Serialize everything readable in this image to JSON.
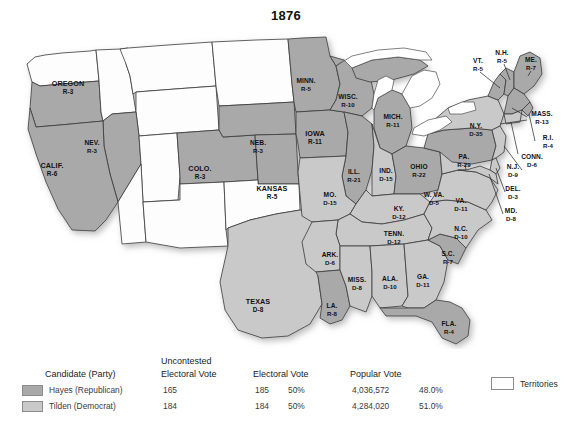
{
  "title": "1876",
  "colors": {
    "republican": "#a9a9a9",
    "democrat": "#c9c9c9",
    "territory": "#fdfdfd",
    "border": "#3a3a3a",
    "water": "#ffffff",
    "text": "#111111"
  },
  "legend": {
    "headers": {
      "candidate": "Candidate (Party)",
      "uncontested_line1": "Uncontested",
      "uncontested_line2": "Electoral Vote",
      "electoral": "Electoral Vote",
      "popular": "Popular Vote"
    },
    "rows": [
      {
        "swatch": "republican",
        "candidate": "Hayes (Republican)",
        "uncontested": "165",
        "electoral": "185",
        "electoral_pct": "50%",
        "popular": "4,036,572",
        "popular_pct": "48.0%"
      },
      {
        "swatch": "democrat",
        "candidate": "Tilden (Democrat)",
        "uncontested": "184",
        "electoral": "184",
        "electoral_pct": "50%",
        "popular": "4,284,020",
        "popular_pct": "51.0%"
      }
    ],
    "territories_label": "Territories"
  },
  "chart_data": {
    "type": "map",
    "title": "1876",
    "legend_position": "bottom",
    "party_codes": {
      "R": "Republican (Hayes)",
      "D": "Democrat (Tilden)",
      "T": "Territory"
    },
    "totals": {
      "hayes_electoral": 185,
      "tilden_electoral": 184,
      "hayes_uncontested": 165,
      "tilden_uncontested": 184,
      "hayes_popular": 4036572,
      "tilden_popular": 4284020,
      "hayes_popular_pct": 48.0,
      "tilden_popular_pct": 51.0,
      "hayes_electoral_pct": 50,
      "tilden_electoral_pct": 50
    },
    "states": [
      {
        "name": "OREGON",
        "party": "R",
        "ev": 3,
        "label": "OREGON",
        "ev_label": "R-3",
        "x": 68,
        "y": 64,
        "size": "big"
      },
      {
        "name": "CALIF.",
        "party": "R",
        "ev": 6,
        "label": "CALIF.",
        "ev_label": "R-6",
        "x": 52,
        "y": 146,
        "size": "big"
      },
      {
        "name": "NEV.",
        "party": "R",
        "ev": 3,
        "label": "NEV.",
        "ev_label": "R-3",
        "x": 92,
        "y": 122,
        "size": ""
      },
      {
        "name": "COLO.",
        "party": "R",
        "ev": 3,
        "label": "COLO.",
        "ev_label": "R-3",
        "x": 200,
        "y": 149,
        "size": "big"
      },
      {
        "name": "KANSAS",
        "party": "R",
        "ev": 5,
        "label": "KANSAS",
        "ev_label": "R-5",
        "x": 272,
        "y": 169,
        "size": "big"
      },
      {
        "name": "NEB.",
        "party": "R",
        "ev": 3,
        "label": "NEB.",
        "ev_label": "R-3",
        "x": 258,
        "y": 122,
        "size": ""
      },
      {
        "name": "MINN.",
        "party": "R",
        "ev": 5,
        "label": "MINN.",
        "ev_label": "R-5",
        "x": 306,
        "y": 60,
        "size": ""
      },
      {
        "name": "IOWA",
        "party": "R",
        "ev": 11,
        "label": "IOWA",
        "ev_label": "R-11",
        "x": 315,
        "y": 114,
        "size": "big"
      },
      {
        "name": "WISC.",
        "party": "R",
        "ev": 10,
        "label": "WISC.",
        "ev_label": "R-10",
        "x": 348,
        "y": 76,
        "size": ""
      },
      {
        "name": "MICH.",
        "party": "R",
        "ev": 11,
        "label": "MICH.",
        "ev_label": "R-11",
        "x": 393,
        "y": 96,
        "size": ""
      },
      {
        "name": "ILL.",
        "party": "R",
        "ev": 21,
        "label": "ILL.",
        "ev_label": "R-21",
        "x": 354,
        "y": 151,
        "size": ""
      },
      {
        "name": "IND.",
        "party": "D",
        "ev": 15,
        "label": "IND.",
        "ev_label": "D-15",
        "x": 386,
        "y": 150,
        "size": ""
      },
      {
        "name": "OHIO",
        "party": "R",
        "ev": 22,
        "label": "OHIO",
        "ev_label": "R-22",
        "x": 419,
        "y": 146,
        "size": ""
      },
      {
        "name": "MO.",
        "party": "D",
        "ev": 15,
        "label": "MO.",
        "ev_label": "D-15",
        "x": 330,
        "y": 174,
        "size": ""
      },
      {
        "name": "KY.",
        "party": "D",
        "ev": 12,
        "label": "KY.",
        "ev_label": "D-12",
        "x": 399,
        "y": 188,
        "size": ""
      },
      {
        "name": "TENN.",
        "party": "D",
        "ev": 12,
        "label": "TENN.",
        "ev_label": "D-12",
        "x": 394,
        "y": 213,
        "size": ""
      },
      {
        "name": "ARK.",
        "party": "D",
        "ev": 6,
        "label": "ARK.",
        "ev_label": "D-6",
        "x": 330,
        "y": 234,
        "size": ""
      },
      {
        "name": "MISS.",
        "party": "D",
        "ev": 8,
        "label": "MISS.",
        "ev_label": "D-8",
        "x": 357,
        "y": 259,
        "size": ""
      },
      {
        "name": "ALA.",
        "party": "D",
        "ev": 10,
        "label": "ALA.",
        "ev_label": "D-10",
        "x": 390,
        "y": 258,
        "size": ""
      },
      {
        "name": "GA.",
        "party": "D",
        "ev": 11,
        "label": "GA.",
        "ev_label": "D-11",
        "x": 423,
        "y": 256,
        "size": ""
      },
      {
        "name": "S.C.",
        "party": "R",
        "ev": 7,
        "label": "S.C.",
        "ev_label": "R-7",
        "x": 448,
        "y": 233,
        "size": ""
      },
      {
        "name": "N.C.",
        "party": "D",
        "ev": 10,
        "label": "N.C.",
        "ev_label": "D-10",
        "x": 461,
        "y": 208,
        "size": ""
      },
      {
        "name": "FLA.",
        "party": "R",
        "ev": 4,
        "label": "FLA.",
        "ev_label": "R-4",
        "x": 449,
        "y": 303,
        "size": ""
      },
      {
        "name": "LA.",
        "party": "R",
        "ev": 8,
        "label": "LA.",
        "ev_label": "R-8",
        "x": 332,
        "y": 285,
        "size": ""
      },
      {
        "name": "TEXAS",
        "party": "D",
        "ev": 8,
        "label": "TEXAS",
        "ev_label": "D-8",
        "x": 258,
        "y": 282,
        "size": "big"
      },
      {
        "name": "VA.",
        "party": "D",
        "ev": 11,
        "label": "VA.",
        "ev_label": "D-11",
        "x": 461,
        "y": 180,
        "size": ""
      },
      {
        "name": "W. VA.",
        "party": "D",
        "ev": 5,
        "label": "W. VA.",
        "ev_label": "D-5",
        "x": 434,
        "y": 174,
        "size": ""
      },
      {
        "name": "PA.",
        "party": "R",
        "ev": 29,
        "label": "PA.",
        "ev_label": "R-29",
        "x": 464,
        "y": 136,
        "size": ""
      },
      {
        "name": "N.Y.",
        "party": "D",
        "ev": 35,
        "label": "N.Y.",
        "ev_label": "D-35",
        "x": 476,
        "y": 105,
        "size": ""
      }
    ],
    "callout_states": [
      {
        "name": "VT.",
        "party": "R",
        "ev": 5,
        "label": "VT.",
        "ev_label": "R-5",
        "x": 478,
        "y": 40
      },
      {
        "name": "N.H.",
        "party": "R",
        "ev": 5,
        "label": "N.H.",
        "ev_label": "R-5",
        "x": 502,
        "y": 32
      },
      {
        "name": "ME.",
        "party": "R",
        "ev": 7,
        "label": "ME.",
        "ev_label": "R-7",
        "x": 531,
        "y": 39
      },
      {
        "name": "MASS.",
        "party": "R",
        "ev": 13,
        "label": "MASS.",
        "ev_label": "R-13",
        "x": 542,
        "y": 93
      },
      {
        "name": "R.I.",
        "party": "R",
        "ev": 4,
        "label": "R.I.",
        "ev_label": "R-4",
        "x": 548,
        "y": 117
      },
      {
        "name": "CONN.",
        "party": "D",
        "ev": 6,
        "label": "CONN.",
        "ev_label": "D-6",
        "x": 532,
        "y": 136
      },
      {
        "name": "N.J.",
        "party": "D",
        "ev": 9,
        "label": "N.J.",
        "ev_label": "D-9",
        "x": 513,
        "y": 146
      },
      {
        "name": "DEL.",
        "party": "D",
        "ev": 3,
        "label": "DEL.",
        "ev_label": "D-3",
        "x": 513,
        "y": 168
      },
      {
        "name": "MD.",
        "party": "D",
        "ev": 8,
        "label": "MD.",
        "ev_label": "D-8",
        "x": 511,
        "y": 190
      }
    ],
    "territories_note": "Unshaded white areas are organized Territories with no electoral votes."
  }
}
